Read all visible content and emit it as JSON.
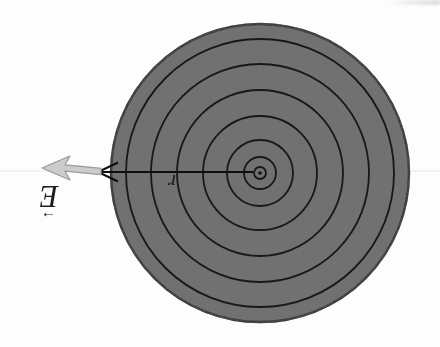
{
  "figure": {
    "background_color": "#fdfdfd",
    "field_vector_label": {
      "symbol": "E",
      "vector_arrow_glyph": "→",
      "rotated_180": true
    },
    "radius_label": {
      "symbol": "r",
      "rotated_180": true
    },
    "disk": {
      "cx": 260,
      "cy": 173,
      "radius": 149,
      "fill": "#6f6f6f",
      "stroke": "#1b1b1b",
      "stroke_width": 2.4
    },
    "contour_circles": {
      "radii": [
        6,
        16,
        33,
        57,
        83,
        109,
        134
      ],
      "color": "#181818",
      "stroke_width": 1.8
    },
    "center_dot": {
      "radius": 1.8,
      "color": "#111111"
    },
    "radius_line": {
      "x1": 253,
      "x2": 98,
      "y": 172,
      "color": "#0d0d0d",
      "width": 2.2,
      "open_arrowhead_back": 20,
      "open_arrowhead_halfwidth": 9.5
    },
    "field_arrow": {
      "tip_x": 42,
      "tip_y": 168,
      "tail_x": 101,
      "tail_y": 171.5,
      "barb_back_x": 70,
      "barb_halfwidth": 12,
      "notch_x": 65,
      "shaft_halfheight": 3.2,
      "fill": "#cfcfcf",
      "stroke": "#8d8d8d"
    },
    "guide_line": {
      "y": 171,
      "color": "#e9e9e9",
      "width": 1.2
    }
  }
}
